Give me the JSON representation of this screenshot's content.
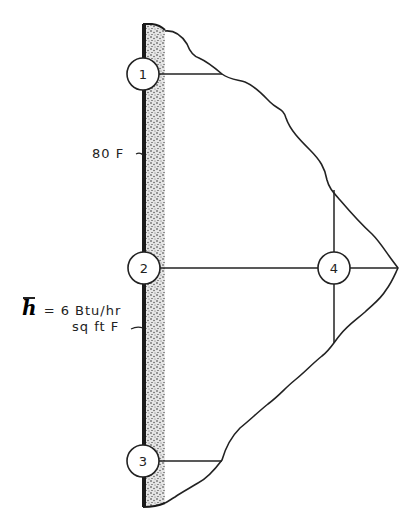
{
  "diagram": {
    "wall": {
      "description": "stippled wall surface",
      "x": 143,
      "width": 22,
      "y_top": 24,
      "y_bottom": 507
    },
    "nodes": [
      {
        "id": "1",
        "label": "1",
        "cx": 143,
        "cy": 74
      },
      {
        "id": "2",
        "label": "2",
        "cx": 144,
        "cy": 268
      },
      {
        "id": "3",
        "label": "3",
        "cx": 143,
        "cy": 461
      },
      {
        "id": "4",
        "label": "4",
        "cx": 334,
        "cy": 268
      }
    ],
    "labels": {
      "temperature": "80 F",
      "h_symbol": "h",
      "h_value": "= 6  Btu/hr",
      "h_units": "sq  ft  F"
    },
    "colors": {
      "ink": "#222222",
      "background": "#ffffff"
    }
  }
}
